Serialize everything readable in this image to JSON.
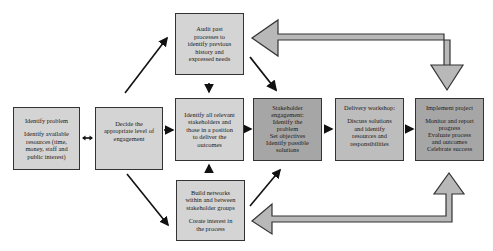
{
  "diagram": {
    "boxes": {
      "identify_problem": {
        "title": "Identify problem",
        "lines": [
          "Identify available",
          "resources (time,",
          "money, staff and",
          "public interest)"
        ]
      },
      "decide_level": {
        "lines": [
          "Decide the",
          "appropriate level of",
          "engagement"
        ]
      },
      "audit": {
        "lines": [
          "Audit past",
          "processes to",
          "identify previous",
          "history and",
          "expressed needs"
        ]
      },
      "identify_stakeholders": {
        "lines": [
          "Identify all relevant",
          "stakeholders and",
          "those in a position",
          "to deliver the",
          "outcomes"
        ]
      },
      "build_networks": {
        "lines": [
          "Build networks",
          "within and between",
          "stakeholder groups"
        ],
        "lines2": [
          "Create interest in",
          "the process"
        ]
      },
      "stakeholder_engagement": {
        "lines": [
          "Stakeholder",
          "engagement:",
          "Identify the",
          "problem",
          "Set objectives",
          "Identify possible",
          "solutions"
        ]
      },
      "delivery_workshop": {
        "title": "Delivery workshop:",
        "lines": [
          "Discuss solutions",
          "and identify",
          "resources and",
          "responsibilities"
        ]
      },
      "implement_project": {
        "title": "Implement project",
        "lines": [
          "Monitor and report",
          "progress",
          "Evaluate process",
          "and outcomes",
          "Celebrate success"
        ]
      }
    },
    "colors": {
      "light_box": "#d4d4d4",
      "mid_box": "#bdbdbd",
      "dark_box": "#a6a6a6",
      "feedback_arrow": "#b8b8b8",
      "border": "#333333"
    }
  }
}
